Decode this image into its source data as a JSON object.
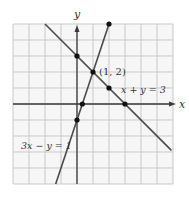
{
  "chart_data": {
    "type": "line",
    "title": "",
    "xlabel": "x",
    "ylabel": "y",
    "xlim": [
      -4,
      6
    ],
    "ylim": [
      -5,
      5
    ],
    "grid": true,
    "grid_step": 1,
    "series": [
      {
        "name": "x + y = 3",
        "equation": "x + y = 3",
        "x": [
          -2,
          5.9
        ],
        "y": [
          5,
          -2.9
        ],
        "marked_points": [
          [
            0,
            3
          ],
          [
            1,
            2
          ],
          [
            2,
            1
          ],
          [
            3,
            0
          ]
        ]
      },
      {
        "name": "3x - y = 1",
        "equation": "3x - y = 1",
        "x": [
          -1.333,
          2
        ],
        "y": [
          -5,
          5
        ],
        "marked_points": [
          [
            2,
            5
          ],
          [
            1,
            2
          ],
          [
            0.333,
            0
          ],
          [
            0,
            -1
          ]
        ]
      }
    ],
    "annotations": [
      {
        "text": "(1, 2)",
        "x": 1,
        "y": 2,
        "role": "intersection"
      },
      {
        "text": "x + y = 3",
        "role": "line-label"
      },
      {
        "text": "3x − y = 1",
        "role": "line-label"
      }
    ]
  },
  "labels": {
    "x_axis": "x",
    "y_axis": "y",
    "intersection": "(1, 2)",
    "line1": "x + y = 3",
    "line2": "3x − y = 1"
  },
  "colors": {
    "grid": "#c9c9c9",
    "plot_bg": "#f6f6f6",
    "axis": "#3a3a3a",
    "line": "#4a4a4a",
    "dot": "#111111"
  }
}
